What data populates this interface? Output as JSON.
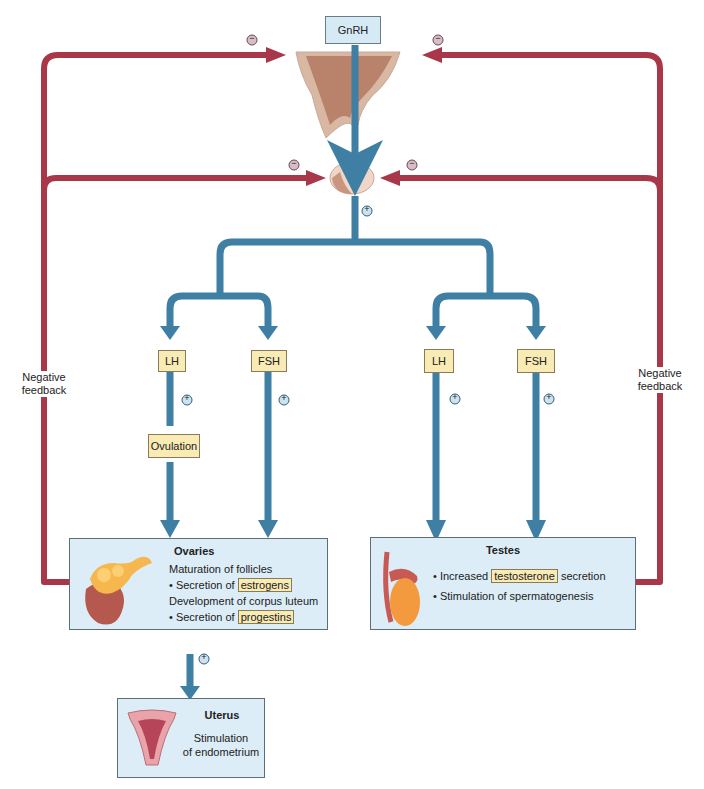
{
  "hypothalamus": {
    "hormone": "GnRH"
  },
  "feedback": {
    "left_label": "Negative feedback",
    "right_label": "Negative feedback",
    "sign": "−"
  },
  "stimulation_sign": "+",
  "female": {
    "lh": "LH",
    "fsh": "FSH",
    "ovulation": "Ovulation",
    "ovaries": {
      "title": "Ovaries",
      "lines": [
        {
          "text": "Maturation of follicles"
        },
        {
          "bullet": "• Secretion of ",
          "highlight": "estrogens"
        },
        {
          "text": "Development of corpus luteum"
        },
        {
          "bullet": "• Secretion of ",
          "highlight": "progestins"
        }
      ]
    },
    "uterus": {
      "title": "Uterus",
      "line1": "Stimulation",
      "line2": "of endometrium"
    }
  },
  "male": {
    "lh": "LH",
    "fsh": "FSH",
    "testes": {
      "title": "Testes",
      "line1_prefix": "• Increased ",
      "line1_highlight": "testosterone",
      "line1_suffix": " secretion",
      "line2": "• Stimulation of spermatogenesis"
    }
  },
  "colors": {
    "stimulation_arrow": "#3f7fa3",
    "feedback_arrow": "#a8374a",
    "label_fill": "#f8ebb4",
    "panel_fill": "#dcedf7"
  }
}
